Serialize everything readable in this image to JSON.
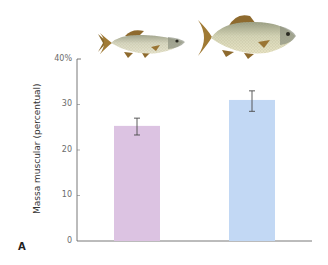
{
  "chart_data": {
    "type": "bar",
    "title": "",
    "panel_label": "A",
    "xlabel": "",
    "ylabel": "Massa muscular (percentual)",
    "ylim": [
      0,
      40
    ],
    "yticks": [
      0,
      10,
      20,
      30,
      40
    ],
    "ytick_labels": [
      "0",
      "10",
      "20",
      "30",
      "40%"
    ],
    "grid": false,
    "legend": null,
    "categories": [
      "Peixe menor",
      "Peixe maior"
    ],
    "category_icons": [
      "small-fish-illustration",
      "large-fish-illustration"
    ],
    "values": [
      25.3,
      31.0
    ],
    "error_bars": [
      {
        "low": 23.3,
        "high": 27.0
      },
      {
        "low": 28.5,
        "high": 33.0
      }
    ],
    "colors": [
      "#dcc3e2",
      "#c2d8f4"
    ]
  },
  "axis": {
    "ylabel": "Massa muscular (percentual)",
    "ticks": [
      "0",
      "10",
      "20",
      "30",
      "40%"
    ]
  },
  "panel": {
    "label": "A"
  }
}
